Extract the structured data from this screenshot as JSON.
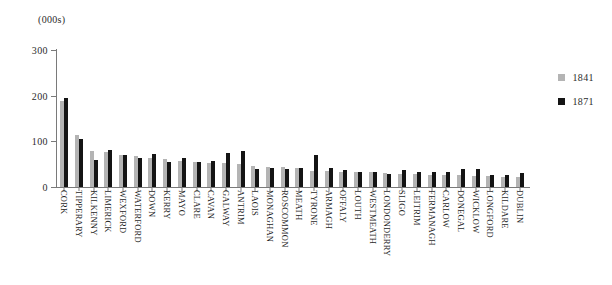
{
  "unit_label": "(000s)",
  "legend": {
    "position": "right",
    "entries": [
      {
        "label": "1841",
        "color": "#b4b4b4"
      },
      {
        "label": "1871",
        "color": "#141414"
      }
    ]
  },
  "axis": {
    "y_ticks": [
      "300",
      "200",
      "100",
      "0"
    ]
  },
  "chart_data": {
    "type": "bar",
    "title": "",
    "subtitle": "",
    "xlabel": "",
    "ylabel": "(000s)",
    "ylim": [
      0,
      300
    ],
    "yticks": [
      0,
      100,
      200,
      300
    ],
    "grid": false,
    "legend_position": "right",
    "categories": [
      "CORK",
      "TIPPERARY",
      "KILKENNY",
      "LIMERICK",
      "WEXFORD",
      "WATERFORD",
      "DOWN",
      "KERRY",
      "MAYO",
      "CLARE",
      "CAVAN",
      "GALWAY",
      "ANTRIM",
      "LAOIS",
      "MONAGHAN",
      "ROSCOMMON",
      "MEATH",
      "TYRONE",
      "ARMAGH",
      "OFFALY",
      "LOUTH",
      "WESTMEATH",
      "LONDONDERRY",
      "SLIGO",
      "LEITRIM",
      "FERMANAGH",
      "CARLOW",
      "DONEGAL",
      "WICKLOW",
      "LONGFORD",
      "KILDARE",
      "DUBLIN"
    ],
    "series": [
      {
        "name": "1841",
        "color": "#b4b4b4",
        "values": [
          188,
          113,
          79,
          76,
          70,
          68,
          63,
          61,
          58,
          54,
          53,
          52,
          51,
          45,
          44,
          43,
          42,
          34,
          34,
          33,
          33,
          32,
          30,
          29,
          28,
          27,
          27,
          26,
          25,
          24,
          23,
          22
        ]
      },
      {
        "name": "1871",
        "color": "#141414",
        "values": [
          196,
          105,
          60,
          80,
          70,
          63,
          72,
          55,
          63,
          55,
          57,
          75,
          78,
          40,
          42,
          40,
          42,
          71,
          42,
          37,
          32,
          33,
          29,
          38,
          32,
          33,
          32,
          40,
          40,
          27,
          27,
          30
        ]
      }
    ]
  }
}
